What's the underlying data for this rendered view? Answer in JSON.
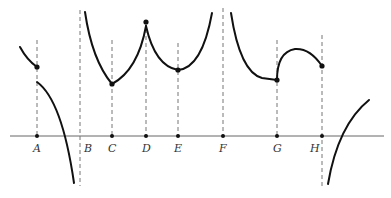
{
  "figure": {
    "points": [
      {
        "label": "A"
      },
      {
        "label": "B"
      },
      {
        "label": "C"
      },
      {
        "label": "D"
      },
      {
        "label": "E"
      },
      {
        "label": "F"
      },
      {
        "label": "G"
      },
      {
        "label": "H"
      }
    ]
  },
  "colors": {
    "curve": "#111111",
    "axis": "#666666",
    "guide": "#777777"
  }
}
